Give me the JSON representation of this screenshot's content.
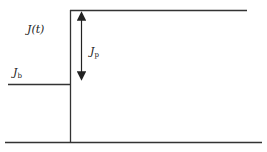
{
  "diagram": {
    "labels": {
      "function": "J(t)",
      "base_main": "J",
      "base_sub": "b",
      "pulse_main": "J",
      "pulse_sub": "p"
    },
    "colors": {
      "line": "#222222",
      "background": "#ffffff"
    }
  }
}
